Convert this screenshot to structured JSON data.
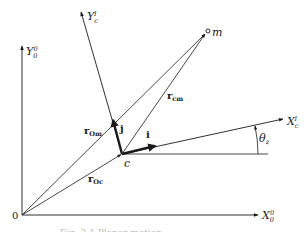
{
  "figure": {
    "origin_label": "0",
    "axes": {
      "Y0": {
        "label": "Y",
        "sub": "0",
        "sup": "0"
      },
      "X0": {
        "label": "X",
        "sub": "0",
        "sup": "0"
      },
      "Yc": {
        "label": "Y",
        "sub": "c",
        "sup": "I"
      },
      "Xc": {
        "label": "X",
        "sub": "c",
        "sup": "I"
      }
    },
    "points": {
      "c": "c",
      "m": "m"
    },
    "vectors": {
      "r0m": {
        "label": "r",
        "sub": "Om"
      },
      "r0c": {
        "label": "r",
        "sub": "Oc"
      },
      "rcm": {
        "label": "r",
        "sub": "cm"
      },
      "i": {
        "label": "i"
      },
      "j": {
        "label": "j"
      }
    },
    "angle": {
      "label": "θ",
      "sub": "z"
    },
    "caption": "Fig. 2.1  Planar motion",
    "colors": {
      "ink": "#1a1a1a",
      "background": "#ffffff"
    }
  }
}
